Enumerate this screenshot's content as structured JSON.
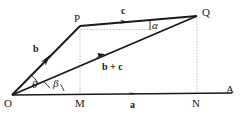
{
  "figure": {
    "type": "geometry-vector-diagram",
    "width": 246,
    "height": 119,
    "background_color": "#ffffff",
    "stroke_color": "#1a1a1a",
    "dotted_color": "#9a9a9a"
  },
  "points": [
    {
      "name": "O",
      "label": "O",
      "x": 12,
      "y": 95,
      "label_x": 5,
      "label_y": 99
    },
    {
      "name": "M",
      "label": "M",
      "x": 80,
      "y": 95,
      "label_x": 76,
      "label_y": 99
    },
    {
      "name": "N",
      "label": "N",
      "x": 197,
      "y": 95,
      "label_x": 193,
      "label_y": 99
    },
    {
      "name": "A",
      "label": "A",
      "x": 232,
      "y": 95,
      "label_x": 227,
      "label_y": 87
    },
    {
      "name": "P",
      "label": "P",
      "x": 80,
      "y": 26,
      "label_x": 75,
      "label_y": 14
    },
    {
      "name": "Q",
      "label": "Q",
      "x": 197,
      "y": 16,
      "label_x": 202,
      "label_y": 9
    }
  ],
  "vectors": [
    {
      "name": "a",
      "label": "a",
      "from": "O",
      "to": "A",
      "label_x": 132,
      "label_y": 100
    },
    {
      "name": "b",
      "label": "b",
      "from": "O",
      "to": "P",
      "label_x": 35,
      "label_y": 45
    },
    {
      "name": "c",
      "label": "c",
      "from": "P",
      "to": "Q",
      "label_x": 122,
      "label_y": 8
    },
    {
      "name": "b-plus-c",
      "label": "b + c",
      "from": "O",
      "to": "Q",
      "label_x": 104,
      "label_y": 62
    }
  ],
  "angles": [
    {
      "name": "theta",
      "label": "θ",
      "between": "b and b+c",
      "label_x": 34,
      "label_y": 82
    },
    {
      "name": "beta",
      "label": "β",
      "between": "b+c and a",
      "label_x": 55,
      "label_y": 81
    },
    {
      "name": "alpha",
      "label": "α",
      "between": "c and horizontal",
      "label_x": 152,
      "label_y": 24
    }
  ],
  "guides": [
    {
      "name": "p-to-m-vertical",
      "from_x": 80,
      "from_y": 27,
      "to_x": 80,
      "to_y": 94
    },
    {
      "name": "q-to-n-vertical",
      "from_x": 197,
      "from_y": 18,
      "to_x": 197,
      "to_y": 94
    },
    {
      "name": "p-horizontal",
      "from_x": 81,
      "from_y": 29,
      "to_x": 153,
      "to_y": 29
    }
  ]
}
